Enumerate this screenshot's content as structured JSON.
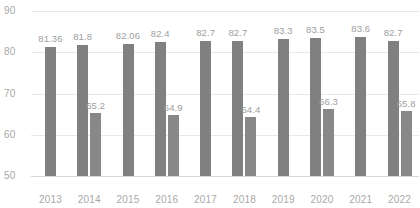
{
  "chart_data": {
    "type": "bar",
    "title": "",
    "subtitle": "",
    "xlabel": "",
    "ylabel": "",
    "categories": [
      "2013",
      "2014",
      "2015",
      "2016",
      "2017",
      "2018",
      "2019",
      "2020",
      "2021",
      "2022"
    ],
    "series": [
      {
        "name": "series-1",
        "values": [
          81.36,
          81.8,
          82.06,
          82.4,
          82.7,
          82.7,
          83.3,
          83.5,
          83.6,
          82.7
        ],
        "labels": [
          "81.36",
          "81.8",
          "82.06",
          "82.4",
          "82.7",
          "82.7",
          "83.3",
          "83.5",
          "83.6",
          "82.7"
        ],
        "color": "#808080"
      },
      {
        "name": "series-2",
        "values": [
          null,
          65.2,
          null,
          64.9,
          null,
          64.4,
          null,
          66.3,
          null,
          65.8
        ],
        "labels": [
          "",
          "65.2",
          "",
          "64.9",
          "",
          "64.4",
          "",
          "66.3",
          "",
          "65.8"
        ],
        "color": "#888888"
      }
    ],
    "ylim": [
      50,
      90
    ],
    "yticks": [
      50,
      60,
      70,
      80,
      90
    ],
    "ytick_labels": [
      "50",
      "60",
      "70",
      "80",
      "90"
    ],
    "grid": true,
    "legend": "none",
    "colors": {
      "bar_primary": "#808080",
      "bar_secondary": "#888888",
      "gridline": "#e8e8e8",
      "axis": "#d9d9d9",
      "tick_text": "#a8a8a8",
      "label_text": "#9e9e9e",
      "background": "#ffffff"
    }
  },
  "axis": {
    "y": {
      "ticks": [
        {
          "value": "90",
          "pos": 90
        },
        {
          "value": "80",
          "pos": 80
        },
        {
          "value": "70",
          "pos": 70
        },
        {
          "value": "60",
          "pos": 60
        },
        {
          "value": "50",
          "pos": 50
        }
      ]
    },
    "x": {
      "ticks": [
        "2013",
        "2014",
        "2015",
        "2016",
        "2017",
        "2018",
        "2019",
        "2020",
        "2021",
        "2022"
      ]
    }
  },
  "bars": [
    {
      "year": "2013",
      "v1": 81.36,
      "l1": "81.36",
      "v2": null,
      "l2": ""
    },
    {
      "year": "2014",
      "v1": 81.8,
      "l1": "81.8",
      "v2": 65.2,
      "l2": "65.2"
    },
    {
      "year": "2015",
      "v1": 82.06,
      "l1": "82.06",
      "v2": null,
      "l2": ""
    },
    {
      "year": "2016",
      "v1": 82.4,
      "l1": "82.4",
      "v2": 64.9,
      "l2": "64.9"
    },
    {
      "year": "2017",
      "v1": 82.7,
      "l1": "82.7",
      "v2": null,
      "l2": ""
    },
    {
      "year": "2018",
      "v1": 82.7,
      "l1": "82.7",
      "v2": 64.4,
      "l2": "64.4"
    },
    {
      "year": "2019",
      "v1": 83.3,
      "l1": "83.3",
      "v2": null,
      "l2": ""
    },
    {
      "year": "2020",
      "v1": 83.5,
      "l1": "83.5",
      "v2": 66.3,
      "l2": "66.3"
    },
    {
      "year": "2021",
      "v1": 83.6,
      "l1": "83.6",
      "v2": null,
      "l2": ""
    },
    {
      "year": "2022",
      "v1": 82.7,
      "l1": "82.7",
      "v2": 65.8,
      "l2": "65.8"
    }
  ]
}
